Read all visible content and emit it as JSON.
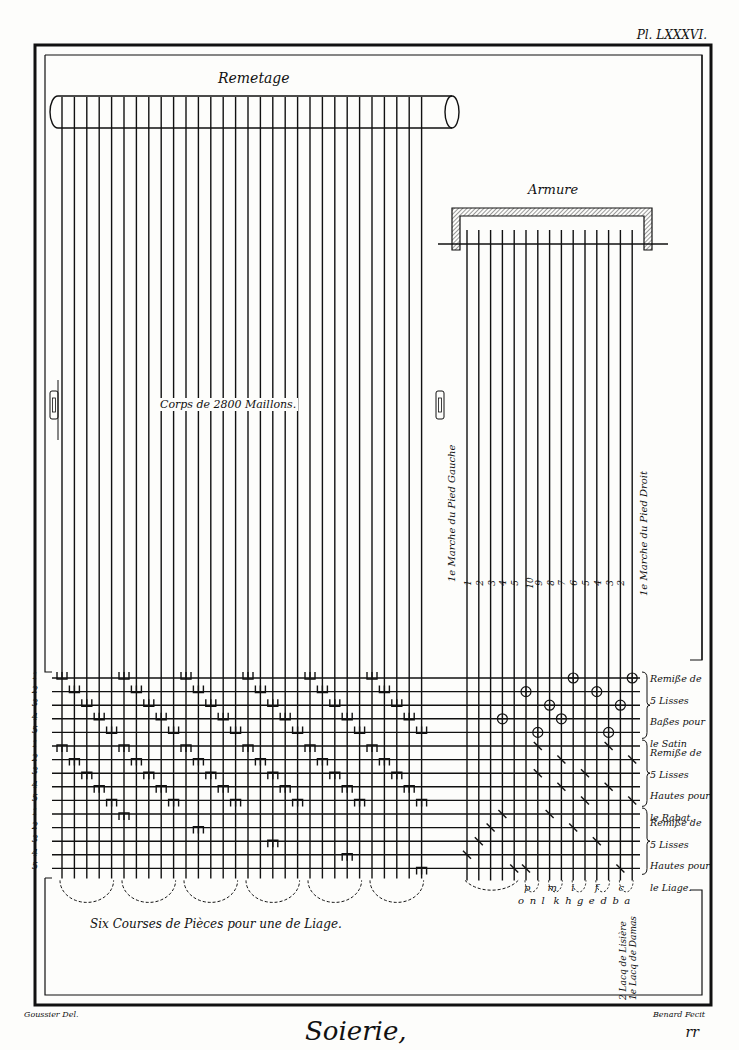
{
  "plate": {
    "number": "Pl. LXXXVI.",
    "title": "Soierie,",
    "signature_left": "Goussier Del.",
    "signature_right": "Benard Fecit",
    "page_mark": "rr"
  },
  "remetage": {
    "label": "Remetage",
    "corps_label": "Corps de 2800 Maillons.",
    "thread_count": 30,
    "thread_x_start": 62,
    "thread_spacing": 12.4
  },
  "armure": {
    "label": "Armure",
    "thread_count": 15,
    "left_marche_label": "1e Marche du Pied Gauche",
    "right_marche_label": "1e Marche du Pied Droit",
    "marche_numbers": [
      "1",
      "2",
      "3",
      "4",
      "5",
      "10",
      "9",
      "8",
      "7",
      "6",
      "5",
      "4",
      "3",
      "2"
    ]
  },
  "grid": {
    "row_labels": [
      "1",
      "2",
      "3",
      "4",
      "5",
      "1",
      "2",
      "3",
      "4",
      "5",
      "1",
      "2",
      "3",
      "4",
      "5"
    ],
    "top_y": 678,
    "row_spacing": 13.6
  },
  "side_labels": [
    {
      "lines": [
        "Remiße de",
        "5 Lisses",
        "Baßes pour",
        "le Satin"
      ]
    },
    {
      "lines": [
        "Remiße de",
        "5 Lisses",
        "Hautes pour",
        "le Rabat."
      ]
    },
    {
      "lines": [
        "Remiße de",
        "5 Lisses",
        "Hautes pour",
        "le Liage."
      ]
    }
  ],
  "bottom": {
    "courses_label": "Six Courses de Pièces pour une de Liage.",
    "upper_letters": [
      "p",
      "m",
      "i",
      "f",
      "c"
    ],
    "lower_letters": [
      "o",
      "n",
      "l",
      "k",
      "h",
      "g",
      "e",
      "d",
      "b",
      "a"
    ],
    "lacq_labels": [
      "2 Lacq de Lisière",
      "1e Lacq de Damas"
    ]
  },
  "colors": {
    "ink": "#111111",
    "paper": "#fdfdfb",
    "hatch": "#555555"
  }
}
